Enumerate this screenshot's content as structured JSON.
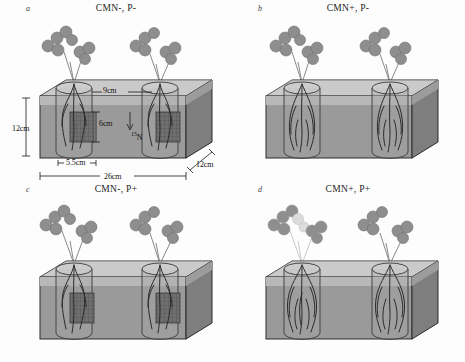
{
  "figure": {
    "caption_present": false,
    "colors": {
      "soil_front": "#9a9a9a",
      "soil_top": "#c3c3c3",
      "soil_side": "#7e7e7e",
      "soil_surface_band": "#b4b4b4",
      "mesh_bag": "#6a6a6a",
      "leaf": "#8e8e8e",
      "leaf_pale": "#cfcfcf",
      "root": "#2b2b2b",
      "outline": "#2a2a2a",
      "text": "#111111"
    }
  },
  "panels": [
    {
      "letter": "a",
      "title": "CMN-, P-",
      "cmn": "absent",
      "phosphorus": "low",
      "mesh_bags": true,
      "pale_plant": false,
      "dimensions": [
        {
          "name": "box-height",
          "label": "12cm"
        },
        {
          "name": "cylinder-depth",
          "label": "9cm"
        },
        {
          "name": "mesh-bag-height",
          "label": "6cm"
        },
        {
          "name": "isotope-tracer",
          "label": "N",
          "superscript": "15"
        },
        {
          "name": "cylinder-diameter",
          "label": "5.5cm"
        },
        {
          "name": "box-width",
          "label": "26cm"
        },
        {
          "name": "box-depth",
          "label": "12cm"
        }
      ]
    },
    {
      "letter": "b",
      "title": "CMN+, P-",
      "cmn": "present",
      "phosphorus": "low",
      "mesh_bags": false,
      "pale_plant": false,
      "dimensions": []
    },
    {
      "letter": "c",
      "title": "CMN-, P+",
      "cmn": "absent",
      "phosphorus": "high",
      "mesh_bags": true,
      "pale_plant": false,
      "dimensions": []
    },
    {
      "letter": "d",
      "title": "CMN+, P+",
      "cmn": "present",
      "phosphorus": "high",
      "mesh_bags": false,
      "pale_plant": true,
      "dimensions": []
    }
  ]
}
